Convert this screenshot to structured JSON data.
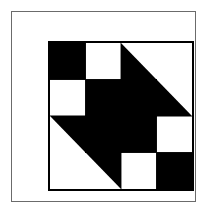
{
  "artwork": {
    "title": "Quilt Block Pattern",
    "description": "Four-by-four patchwork quilt block with rotational symmetry",
    "canvas_width": 211,
    "canvas_height": 216,
    "colors": {
      "background": "#ffffff",
      "ink": "#000000",
      "frame_line": "#6b6b6b",
      "block_border": "#000000"
    },
    "frame": {
      "x": 11,
      "y": 11,
      "width": 185,
      "height": 191,
      "line_width": 1
    },
    "block": {
      "x": 36,
      "y": 29,
      "width": 146,
      "height": 150,
      "border_width": 2,
      "grid_rows": 4,
      "grid_cols": 4,
      "cell_width": 35.5,
      "cell_height": 36.5
    },
    "cells": [
      {
        "row": 0,
        "col": 0,
        "type": "solid",
        "fill": "#000000",
        "name": "cell-r0c0-black"
      },
      {
        "row": 0,
        "col": 1,
        "type": "solid",
        "fill": "#ffffff",
        "name": "cell-r0c1-white"
      },
      {
        "row": 0,
        "col": 2,
        "type": "triangle",
        "fill": "#000000",
        "corner": "bottom-left",
        "name": "cell-r0c2-half-square-triangle"
      },
      {
        "row": 0,
        "col": 3,
        "type": "solid",
        "fill": "#ffffff",
        "name": "cell-r0c3-white"
      },
      {
        "row": 1,
        "col": 0,
        "type": "solid",
        "fill": "#ffffff",
        "name": "cell-r1c0-white"
      },
      {
        "row": 1,
        "col": 1,
        "type": "solid",
        "fill": "#000000",
        "name": "cell-r1c1-black"
      },
      {
        "row": 1,
        "col": 2,
        "type": "solid",
        "fill": "#000000",
        "name": "cell-r1c2-black"
      },
      {
        "row": 1,
        "col": 3,
        "type": "triangle",
        "fill": "#000000",
        "corner": "bottom-left",
        "name": "cell-r1c3-half-square-triangle"
      },
      {
        "row": 2,
        "col": 0,
        "type": "triangle",
        "fill": "#000000",
        "corner": "top-right",
        "name": "cell-r2c0-half-square-triangle"
      },
      {
        "row": 2,
        "col": 1,
        "type": "solid",
        "fill": "#000000",
        "name": "cell-r2c1-black"
      },
      {
        "row": 2,
        "col": 2,
        "type": "solid",
        "fill": "#000000",
        "name": "cell-r2c2-black"
      },
      {
        "row": 2,
        "col": 3,
        "type": "solid",
        "fill": "#ffffff",
        "name": "cell-r2c3-white"
      },
      {
        "row": 3,
        "col": 0,
        "type": "solid",
        "fill": "#ffffff",
        "name": "cell-r3c0-white"
      },
      {
        "row": 3,
        "col": 1,
        "type": "triangle",
        "fill": "#000000",
        "corner": "top-right",
        "name": "cell-r3c1-half-square-triangle"
      },
      {
        "row": 3,
        "col": 2,
        "type": "solid",
        "fill": "#ffffff",
        "name": "cell-r3c2-white"
      },
      {
        "row": 3,
        "col": 3,
        "type": "solid",
        "fill": "#000000",
        "name": "cell-r3c3-black"
      }
    ]
  }
}
